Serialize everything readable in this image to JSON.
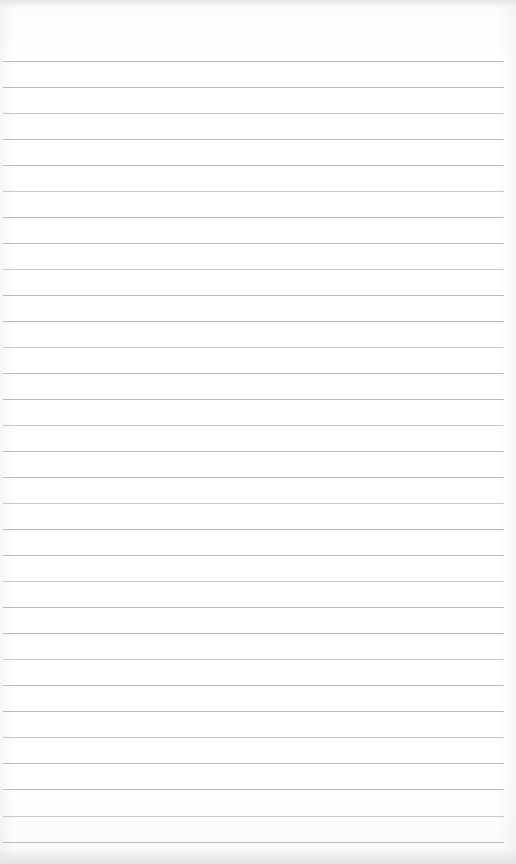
{
  "document": {
    "kind": "ruled-notepad-page",
    "title": "",
    "header_text": "",
    "footer_text": "",
    "body_text": "",
    "is_blank": true,
    "paper_color": "#fdfdfd",
    "rule_color": "#aeb2bb",
    "page_width": 516,
    "page_height": 864,
    "top_margin": 61,
    "rule_spacing": 26,
    "rule_left": 3,
    "rule_right": 504,
    "rule_count": 31,
    "lines": [
      {
        "index": 1,
        "y": 61,
        "text": ""
      },
      {
        "index": 2,
        "y": 87,
        "text": ""
      },
      {
        "index": 3,
        "y": 113,
        "text": ""
      },
      {
        "index": 4,
        "y": 139,
        "text": ""
      },
      {
        "index": 5,
        "y": 165,
        "text": ""
      },
      {
        "index": 6,
        "y": 191,
        "text": ""
      },
      {
        "index": 7,
        "y": 217,
        "text": ""
      },
      {
        "index": 8,
        "y": 243,
        "text": ""
      },
      {
        "index": 9,
        "y": 269,
        "text": ""
      },
      {
        "index": 10,
        "y": 295,
        "text": ""
      },
      {
        "index": 11,
        "y": 321,
        "text": ""
      },
      {
        "index": 12,
        "y": 347,
        "text": ""
      },
      {
        "index": 13,
        "y": 373,
        "text": ""
      },
      {
        "index": 14,
        "y": 399,
        "text": ""
      },
      {
        "index": 15,
        "y": 425,
        "text": ""
      },
      {
        "index": 16,
        "y": 451,
        "text": ""
      },
      {
        "index": 17,
        "y": 477,
        "text": ""
      },
      {
        "index": 18,
        "y": 503,
        "text": ""
      },
      {
        "index": 19,
        "y": 529,
        "text": ""
      },
      {
        "index": 20,
        "y": 555,
        "text": ""
      },
      {
        "index": 21,
        "y": 581,
        "text": ""
      },
      {
        "index": 22,
        "y": 607,
        "text": ""
      },
      {
        "index": 23,
        "y": 633,
        "text": ""
      },
      {
        "index": 24,
        "y": 659,
        "text": ""
      },
      {
        "index": 25,
        "y": 685,
        "text": ""
      },
      {
        "index": 26,
        "y": 711,
        "text": ""
      },
      {
        "index": 27,
        "y": 737,
        "text": ""
      },
      {
        "index": 28,
        "y": 763,
        "text": ""
      },
      {
        "index": 29,
        "y": 789,
        "text": ""
      },
      {
        "index": 30,
        "y": 816,
        "text": ""
      },
      {
        "index": 31,
        "y": 842,
        "text": ""
      }
    ]
  }
}
